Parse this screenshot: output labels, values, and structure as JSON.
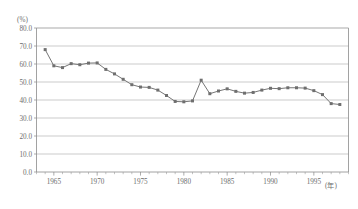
{
  "chart_data": {
    "type": "line",
    "title": "",
    "subtitle": "",
    "xlabel": "(年)",
    "ylabel": "(%)",
    "y_unit": "(%)",
    "x_unit": "(年)",
    "grid": true,
    "legend": "none",
    "xlim": [
      1963,
      1999
    ],
    "ylim": [
      0.0,
      80.0
    ],
    "ytick_labels": [
      "80.0",
      "70.0",
      "60.0",
      "50.0",
      "40.0",
      "30.0",
      "20.0",
      "10.0",
      "0.0"
    ],
    "ytick_values": [
      80.0,
      70.0,
      60.0,
      50.0,
      40.0,
      30.0,
      20.0,
      10.0,
      0.0
    ],
    "xtick_labels": [
      "1965",
      "1970",
      "1975",
      "1980",
      "1985",
      "1990",
      "1995"
    ],
    "xtick_values": [
      1965,
      1970,
      1975,
      1980,
      1985,
      1990,
      1995
    ],
    "x": [
      1964,
      1965,
      1966,
      1967,
      1968,
      1969,
      1970,
      1971,
      1972,
      1973,
      1974,
      1975,
      1976,
      1977,
      1978,
      1979,
      1980,
      1981,
      1982,
      1983,
      1984,
      1985,
      1986,
      1987,
      1988,
      1989,
      1990,
      1991,
      1992,
      1993,
      1994,
      1995,
      1996,
      1997,
      1998
    ],
    "series": [
      {
        "name": "",
        "marker": "square",
        "color": "#6f6f6f",
        "values": [
          68.0,
          59.0,
          58.0,
          60.2,
          59.6,
          60.5,
          60.6,
          57.0,
          54.5,
          51.5,
          48.5,
          47.2,
          47.0,
          45.5,
          42.5,
          39.2,
          39.0,
          39.5,
          51.0,
          43.5,
          45.0,
          46.2,
          44.8,
          43.8,
          44.2,
          45.5,
          46.5,
          46.3,
          46.8,
          46.8,
          46.6,
          45.2,
          43.0,
          38.0,
          37.5
        ]
      }
    ]
  }
}
